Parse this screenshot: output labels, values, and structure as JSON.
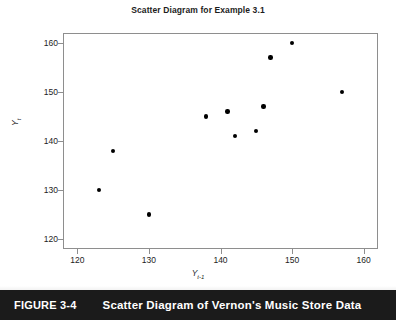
{
  "chart_data": {
    "type": "scatter",
    "title": "Scatter Diagram for Example 3.1",
    "xlabel": "Y t-1",
    "ylabel": "Y t",
    "xlim": [
      118,
      162
    ],
    "ylim": [
      118,
      162
    ],
    "xticks": [
      120,
      130,
      140,
      150,
      160
    ],
    "yticks": [
      120,
      130,
      140,
      150,
      160
    ],
    "grid": false,
    "legend": null,
    "marker": "filled-circle",
    "marker_color": "#000000",
    "x": [
      123,
      125,
      130,
      138,
      141,
      142,
      145,
      146,
      147,
      150,
      157
    ],
    "y": [
      130,
      138,
      125,
      145,
      146,
      141,
      142,
      147,
      157,
      160,
      150
    ],
    "points": [
      {
        "x": 123,
        "y": 130
      },
      {
        "x": 125,
        "y": 138
      },
      {
        "x": 130,
        "y": 125
      },
      {
        "x": 138,
        "y": 145
      },
      {
        "x": 141,
        "y": 146
      },
      {
        "x": 142,
        "y": 141
      },
      {
        "x": 145,
        "y": 142
      },
      {
        "x": 146,
        "y": 147
      },
      {
        "x": 147,
        "y": 157
      },
      {
        "x": 150,
        "y": 160
      },
      {
        "x": 157,
        "y": 150
      }
    ]
  },
  "axis": {
    "y_title_main": "Y",
    "y_title_sub": "t",
    "x_title_main": "Y",
    "x_title_sub": "t-1"
  },
  "caption": {
    "figure_number": "FIGURE 3-4",
    "figure_text": "Scatter Diagram of Vernon's Music Store Data"
  },
  "colors": {
    "frame": "#8e8e8e",
    "marker": "#000000",
    "caption_bar": "#1b1b1b",
    "text": "#1d1d1d"
  }
}
